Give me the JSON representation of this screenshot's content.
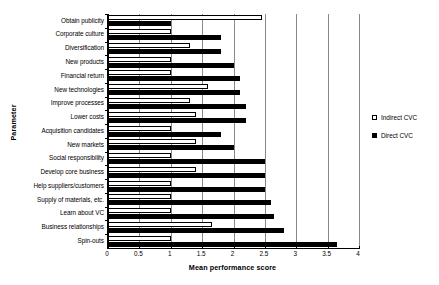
{
  "chart_data": {
    "type": "bar",
    "orientation": "horizontal",
    "title": "",
    "xlabel": "Mean performance score",
    "ylabel": "Parameter",
    "xlim": [
      0,
      4
    ],
    "xticks": [
      "0",
      "0.5",
      "1",
      "1.5",
      "2",
      "2.5",
      "3",
      "3.5",
      "4"
    ],
    "xtick_values": [
      0,
      0.5,
      1,
      1.5,
      2,
      2.5,
      3,
      3.5,
      4
    ],
    "grid": true,
    "legend_position": "right",
    "categories": [
      "Obtain publicity",
      "Corporate culture",
      "Diversification",
      "New products",
      "Financial return",
      "New technologies",
      "Improve processes",
      "Lower costs",
      "Acquisition candidates",
      "New markets",
      "Social responsibility",
      "Develop core business",
      "Help suppliers/customers",
      "Supply of materials, etc.",
      "Learn about VC",
      "Business relationships",
      "Spin-outs"
    ],
    "series": [
      {
        "name": "Indirect CVC",
        "color": "#ffffff",
        "values": [
          2.45,
          1.0,
          1.3,
          1.0,
          1.0,
          1.6,
          1.3,
          1.4,
          1.0,
          1.4,
          1.0,
          1.4,
          1.0,
          1.0,
          1.0,
          1.65,
          1.0
        ]
      },
      {
        "name": "Direct CVC",
        "color": "#000000",
        "values": [
          1.0,
          1.8,
          1.8,
          2.0,
          2.1,
          2.1,
          2.2,
          2.2,
          1.8,
          2.0,
          2.5,
          2.5,
          2.5,
          2.6,
          2.65,
          2.8,
          3.65
        ]
      }
    ]
  },
  "legend": {
    "items": [
      {
        "label": "Indirect CVC",
        "swatch": "hollow-square"
      },
      {
        "label": "Direct CVC",
        "swatch": "filled-square"
      }
    ]
  },
  "axes": {
    "x_title": "Mean performance score",
    "y_title": "Parameter"
  }
}
